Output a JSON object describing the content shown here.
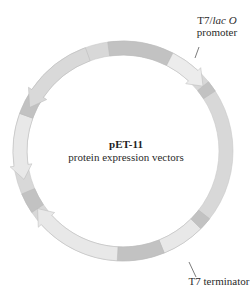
{
  "plasmid": {
    "name": "pET-11",
    "subtitle": "protein expression vectors"
  },
  "labels": {
    "promoter_line1_plain": "T7/",
    "promoter_line1_italic": "lac O",
    "promoter_line2": "promoter",
    "terminator": "T7 terminator"
  },
  "colors": {
    "ring_base": "#d9d9d9",
    "ring_dark": "#c2c2c2",
    "ring_light": "#e8e8e8",
    "promoter": "#ececec",
    "outline": "#b0b0b0",
    "text": "#2a2a2a"
  }
}
